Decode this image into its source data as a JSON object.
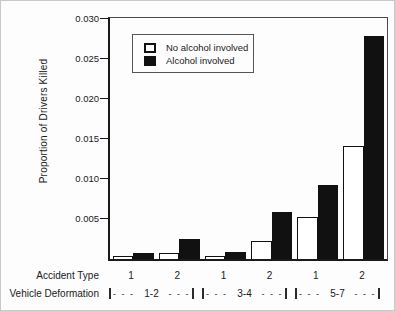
{
  "chart_data": {
    "type": "bar",
    "title": "",
    "ylabel": "Proportion of Drivers Killed",
    "ylim": [
      0,
      0.03
    ],
    "yticks": [
      0.005,
      0.01,
      0.015,
      0.02,
      0.025,
      0.03
    ],
    "ytick_labels": [
      "0.005",
      "0.010",
      "0.015",
      "0.020",
      "0.025",
      "0.030"
    ],
    "grid": false,
    "legend_position": "top-left-inside",
    "series": [
      {
        "name": "No alcohol involved",
        "fill": "#ffffff",
        "values": [
          0.0004,
          0.0008,
          0.0004,
          0.0023,
          0.0052,
          0.0141
        ]
      },
      {
        "name": "Alcohol involved",
        "fill": "#111111",
        "values": [
          0.0008,
          0.0025,
          0.0009,
          0.0058,
          0.0092,
          0.0277
        ]
      }
    ],
    "x_axis": {
      "accident_type_label": "Accident Type",
      "accident_types": [
        "1",
        "2",
        "1",
        "2",
        "1",
        "2"
      ],
      "vehicle_deformation_label": "Vehicle Deformation",
      "deformation_groups": [
        "1-2",
        "3-4",
        "5-7"
      ],
      "bracket_dashes": "- - -"
    }
  }
}
